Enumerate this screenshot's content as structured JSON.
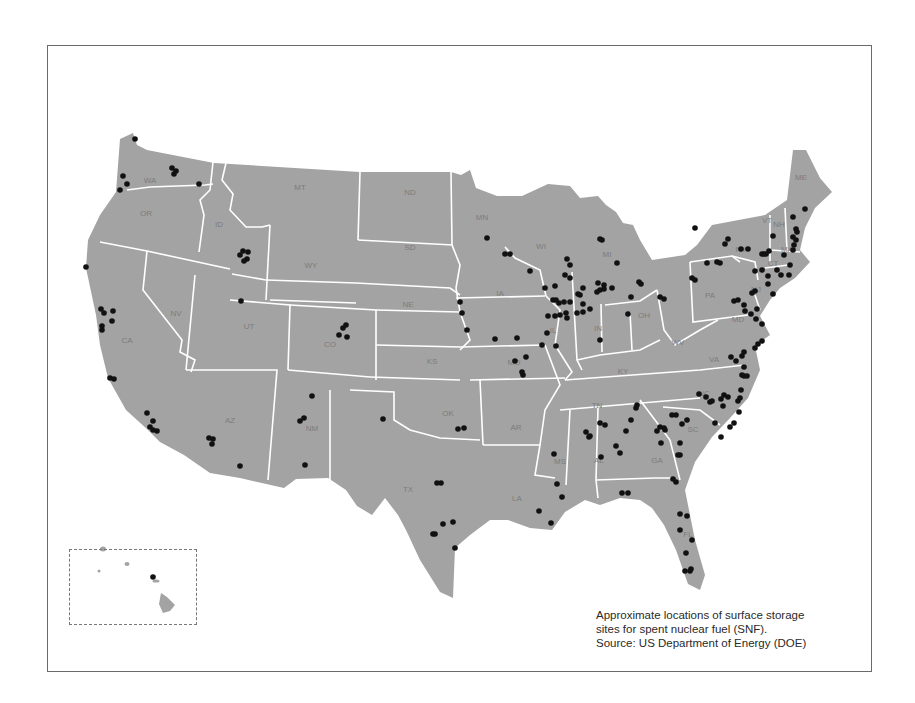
{
  "caption": {
    "line1": "Approximate locations of surface storage",
    "line2": "sites for spent nuclear fuel (SNF).",
    "line3": "Source: US Department of Energy (DOE)"
  },
  "colors": {
    "land": "#a3a3a3",
    "borders": "#ffffff",
    "sites": "#111111",
    "frame": "#6a6a6a",
    "labels": "#7c7c7c"
  },
  "state_labels": [
    {
      "abbr": "WA",
      "x": 150,
      "y": 183
    },
    {
      "abbr": "OR",
      "x": 146,
      "y": 216
    },
    {
      "abbr": "CA",
      "x": 127,
      "y": 343
    },
    {
      "abbr": "NV",
      "x": 176,
      "y": 316
    },
    {
      "abbr": "ID",
      "x": 219,
      "y": 227
    },
    {
      "abbr": "MT",
      "x": 300,
      "y": 190
    },
    {
      "abbr": "WY",
      "x": 311,
      "y": 268
    },
    {
      "abbr": "UT",
      "x": 249,
      "y": 329
    },
    {
      "abbr": "CO",
      "x": 330,
      "y": 347
    },
    {
      "abbr": "AZ",
      "x": 230,
      "y": 423
    },
    {
      "abbr": "NM",
      "x": 312,
      "y": 431
    },
    {
      "abbr": "ND",
      "x": 410,
      "y": 195
    },
    {
      "abbr": "SD",
      "x": 410,
      "y": 250
    },
    {
      "abbr": "NE",
      "x": 408,
      "y": 307
    },
    {
      "abbr": "KS",
      "x": 432,
      "y": 364
    },
    {
      "abbr": "OK",
      "x": 448,
      "y": 416
    },
    {
      "abbr": "TX",
      "x": 408,
      "y": 492
    },
    {
      "abbr": "MN",
      "x": 482,
      "y": 220
    },
    {
      "abbr": "IA",
      "x": 500,
      "y": 296
    },
    {
      "abbr": "MO",
      "x": 514,
      "y": 365
    },
    {
      "abbr": "AR",
      "x": 516,
      "y": 430
    },
    {
      "abbr": "LA",
      "x": 517,
      "y": 501
    },
    {
      "abbr": "WI",
      "x": 541,
      "y": 249
    },
    {
      "abbr": "IL",
      "x": 553,
      "y": 333
    },
    {
      "abbr": "MI",
      "x": 607,
      "y": 257
    },
    {
      "abbr": "IN",
      "x": 598,
      "y": 331
    },
    {
      "abbr": "OH",
      "x": 644,
      "y": 318
    },
    {
      "abbr": "KY",
      "x": 623,
      "y": 374
    },
    {
      "abbr": "TN",
      "x": 597,
      "y": 408
    },
    {
      "abbr": "MS",
      "x": 560,
      "y": 464
    },
    {
      "abbr": "AL",
      "x": 599,
      "y": 463
    },
    {
      "abbr": "GA",
      "x": 657,
      "y": 463
    },
    {
      "abbr": "FL",
      "x": 688,
      "y": 537
    },
    {
      "abbr": "SC",
      "x": 693,
      "y": 432
    },
    {
      "abbr": "NC",
      "x": 704,
      "y": 396
    },
    {
      "abbr": "VA",
      "x": 714,
      "y": 362
    },
    {
      "abbr": "WV",
      "x": 678,
      "y": 345
    },
    {
      "abbr": "PA",
      "x": 710,
      "y": 298
    },
    {
      "abbr": "NY",
      "x": 741,
      "y": 252
    },
    {
      "abbr": "VT",
      "x": 767,
      "y": 223
    },
    {
      "abbr": "NH",
      "x": 779,
      "y": 227
    },
    {
      "abbr": "ME",
      "x": 801,
      "y": 180
    },
    {
      "abbr": "MA",
      "x": 787,
      "y": 252
    },
    {
      "abbr": "CT",
      "x": 773,
      "y": 266
    },
    {
      "abbr": "NJ",
      "x": 756,
      "y": 292
    },
    {
      "abbr": "MD",
      "x": 738,
      "y": 322
    }
  ],
  "sites": [
    [
      135,
      139
    ],
    [
      123,
      176
    ],
    [
      127,
      184
    ],
    [
      120,
      190
    ],
    [
      172,
      168
    ],
    [
      176,
      171
    ],
    [
      174,
      174
    ],
    [
      199,
      184
    ],
    [
      86,
      267
    ],
    [
      101,
      309
    ],
    [
      104,
      313
    ],
    [
      243,
      251
    ],
    [
      248,
      252
    ],
    [
      247,
      259
    ],
    [
      244,
      261
    ],
    [
      240,
      255
    ],
    [
      113,
      311
    ],
    [
      112,
      321
    ],
    [
      102,
      326
    ],
    [
      102,
      330
    ],
    [
      110,
      378
    ],
    [
      114,
      379
    ],
    [
      147,
      413
    ],
    [
      153,
      421
    ],
    [
      150,
      427
    ],
    [
      153,
      430
    ],
    [
      157,
      431
    ],
    [
      241,
      301
    ],
    [
      209,
      438
    ],
    [
      213,
      439
    ],
    [
      212,
      444
    ],
    [
      240,
      466
    ],
    [
      312,
      396
    ],
    [
      300,
      421
    ],
    [
      304,
      418
    ],
    [
      305,
      465
    ],
    [
      343,
      328
    ],
    [
      339,
      335
    ],
    [
      347,
      337
    ],
    [
      346,
      325
    ],
    [
      383,
      419
    ],
    [
      460,
      302
    ],
    [
      462,
      313
    ],
    [
      467,
      330
    ],
    [
      487,
      238
    ],
    [
      505,
      254
    ],
    [
      510,
      254
    ],
    [
      530,
      271
    ],
    [
      545,
      288
    ],
    [
      555,
      286
    ],
    [
      565,
      275
    ],
    [
      570,
      265
    ],
    [
      570,
      278
    ],
    [
      567,
      259
    ],
    [
      495,
      339
    ],
    [
      517,
      338
    ],
    [
      515,
      361
    ],
    [
      526,
      357
    ],
    [
      523,
      375
    ],
    [
      522,
      372
    ],
    [
      458,
      429
    ],
    [
      464,
      428
    ],
    [
      437,
      483
    ],
    [
      441,
      483
    ],
    [
      443,
      524
    ],
    [
      453,
      522
    ],
    [
      455,
      548
    ],
    [
      433,
      534
    ],
    [
      435,
      534
    ],
    [
      554,
      454
    ],
    [
      539,
      511
    ],
    [
      551,
      523
    ],
    [
      557,
      484
    ],
    [
      562,
      497
    ],
    [
      542,
      345
    ],
    [
      556,
      346
    ],
    [
      547,
      333
    ],
    [
      548,
      316
    ],
    [
      555,
      316
    ],
    [
      560,
      315
    ],
    [
      566,
      313
    ],
    [
      567,
      318
    ],
    [
      553,
      300
    ],
    [
      556,
      300
    ],
    [
      559,
      303
    ],
    [
      564,
      302
    ],
    [
      570,
      302
    ],
    [
      578,
      294
    ],
    [
      583,
      288
    ],
    [
      580,
      295
    ],
    [
      583,
      304
    ],
    [
      577,
      313
    ],
    [
      583,
      312
    ],
    [
      590,
      309
    ],
    [
      600,
      340
    ],
    [
      600,
      290
    ],
    [
      604,
      289
    ],
    [
      628,
      314
    ],
    [
      639,
      282
    ],
    [
      641,
      284
    ],
    [
      602,
      240
    ],
    [
      600,
      239
    ],
    [
      617,
      263
    ],
    [
      598,
      283
    ],
    [
      597,
      292
    ],
    [
      604,
      285
    ],
    [
      612,
      288
    ],
    [
      631,
      297
    ],
    [
      660,
      297
    ],
    [
      664,
      299
    ],
    [
      692,
      278
    ],
    [
      707,
      263
    ],
    [
      695,
      280
    ],
    [
      741,
      249
    ],
    [
      748,
      249
    ],
    [
      728,
      239
    ],
    [
      725,
      244
    ],
    [
      717,
      262
    ],
    [
      695,
      228
    ],
    [
      720,
      263
    ],
    [
      764,
      254
    ],
    [
      762,
      254
    ],
    [
      755,
      271
    ],
    [
      762,
      270
    ],
    [
      768,
      276
    ],
    [
      768,
      284
    ],
    [
      773,
      294
    ],
    [
      777,
      270
    ],
    [
      781,
      275
    ],
    [
      790,
      265
    ],
    [
      789,
      275
    ],
    [
      784,
      255
    ],
    [
      794,
      245
    ],
    [
      793,
      250
    ],
    [
      796,
      240
    ],
    [
      797,
      232
    ],
    [
      796,
      229
    ],
    [
      793,
      217
    ],
    [
      805,
      209
    ],
    [
      793,
      237
    ],
    [
      773,
      236
    ],
    [
      769,
      251
    ],
    [
      766,
      254
    ],
    [
      752,
      293
    ],
    [
      755,
      291
    ],
    [
      734,
      301
    ],
    [
      738,
      300
    ],
    [
      744,
      305
    ],
    [
      745,
      311
    ],
    [
      751,
      314
    ],
    [
      757,
      309
    ],
    [
      756,
      319
    ],
    [
      762,
      324
    ],
    [
      762,
      341
    ],
    [
      758,
      344
    ],
    [
      755,
      348
    ],
    [
      744,
      352
    ],
    [
      742,
      356
    ],
    [
      731,
      357
    ],
    [
      736,
      361
    ],
    [
      744,
      367
    ],
    [
      742,
      375
    ],
    [
      744,
      376
    ],
    [
      747,
      376
    ],
    [
      741,
      390
    ],
    [
      738,
      401
    ],
    [
      724,
      395
    ],
    [
      721,
      399
    ],
    [
      723,
      406
    ],
    [
      728,
      397
    ],
    [
      740,
      398
    ],
    [
      739,
      412
    ],
    [
      734,
      423
    ],
    [
      730,
      427
    ],
    [
      721,
      437
    ],
    [
      715,
      423
    ],
    [
      710,
      402
    ],
    [
      712,
      401
    ],
    [
      706,
      397
    ],
    [
      699,
      394
    ],
    [
      687,
      420
    ],
    [
      682,
      424
    ],
    [
      676,
      415
    ],
    [
      672,
      415
    ],
    [
      664,
      428
    ],
    [
      660,
      427
    ],
    [
      636,
      408
    ],
    [
      637,
      405
    ],
    [
      631,
      420
    ],
    [
      626,
      431
    ],
    [
      616,
      446
    ],
    [
      620,
      453
    ],
    [
      600,
      423
    ],
    [
      605,
      425
    ],
    [
      590,
      436
    ],
    [
      586,
      432
    ],
    [
      589,
      437
    ],
    [
      601,
      457
    ],
    [
      661,
      443
    ],
    [
      657,
      431
    ],
    [
      665,
      430
    ],
    [
      680,
      443
    ],
    [
      680,
      455
    ],
    [
      678,
      455
    ],
    [
      676,
      482
    ],
    [
      673,
      479
    ],
    [
      628,
      493
    ],
    [
      622,
      493
    ],
    [
      680,
      514
    ],
    [
      680,
      530
    ],
    [
      687,
      516
    ],
    [
      691,
      569
    ],
    [
      690,
      571
    ],
    [
      685,
      571
    ],
    [
      692,
      540
    ],
    [
      686,
      553
    ],
    [
      153,
      577
    ]
  ],
  "inset": {
    "region": "Hawaii"
  }
}
